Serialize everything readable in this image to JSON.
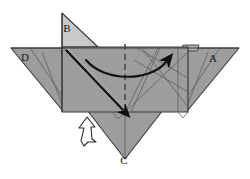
{
  "figure": {
    "kind": "origami-fold-diagram",
    "background_color": "#ffffff",
    "palette": {
      "paper_front": "#9d9d9d",
      "paper_front_shaded": "#8f8f8f",
      "paper_back_light": "#c9c9c9",
      "paper_flap_light": "#b4b4b4",
      "edge_line": "#3a3a3a",
      "crease_line": "#5e5e5e",
      "dashed_fold": "#4a4a4a",
      "arrow_dark": "#111111",
      "arrow_hollow_fill": "#ffffff",
      "label_color": "#1a1a1a"
    },
    "vertex_labels": [
      {
        "id": "label-a",
        "text": "A",
        "x": 213,
        "y": 62
      },
      {
        "id": "label-b",
        "text": "B",
        "x": 67,
        "y": 32
      },
      {
        "id": "label-c",
        "text": "C",
        "x": 124,
        "y": 164
      },
      {
        "id": "label-d",
        "text": "D",
        "x": 25,
        "y": 61
      }
    ],
    "annotations": {
      "curved_arrow_label": "fold-over-arrow",
      "push_arrow_label": "push-in-arrow",
      "valley_fold_label": "dashed-valley-fold-line",
      "slide_arrow_label": "diagonal-slide-arrow"
    }
  }
}
